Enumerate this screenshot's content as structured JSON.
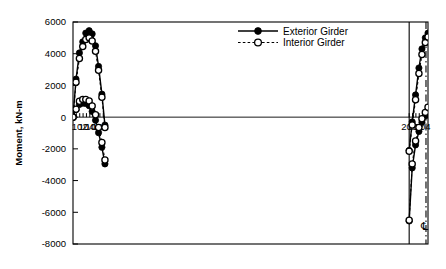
{
  "chart_data": {
    "type": "line",
    "title": "",
    "xlabel": "",
    "ylabel": "Moment, kN-m",
    "ylim": [
      -8000,
      6000
    ],
    "ytick_values": [
      6000,
      4000,
      2000,
      0,
      -2000,
      -4000,
      -6000,
      -8000
    ],
    "ytick_labels": [
      "6000",
      "4000",
      "2000",
      "0",
      "-2000",
      "-4000",
      "-6000",
      "-8000"
    ],
    "xlim": [
      100.0,
      205.6
    ],
    "xtick_values": [
      101,
      102,
      103,
      104,
      105,
      106,
      107,
      108,
      109,
      200,
      201,
      202,
      203,
      204,
      205
    ],
    "xtick_labeled": [
      102,
      104,
      106,
      108,
      200,
      202,
      204
    ],
    "xtick_labels": [
      "102",
      "104",
      "106",
      "108",
      "200",
      "202",
      "204"
    ],
    "grid": false,
    "legend_position": "top-right",
    "series": [
      {
        "name": "Exterior Girder",
        "marker": "filled-circle",
        "linestyle": "solid",
        "color": "#000000",
        "envelopes": [
          {
            "name": "positive-moment-envelope",
            "x": [
              100.0,
              100.9,
              101.9,
              102.9,
              103.8,
              104.8,
              105.7,
              106.7,
              107.6,
              108.6,
              109.5,
              200.0,
              200.9,
              201.9,
              202.9,
              203.8,
              204.8,
              205.6
            ],
            "y": [
              0,
              480,
              800,
              880,
              860,
              720,
              360,
              -200,
              -980,
              -1900,
              -2950,
              -6550,
              -3200,
              -1750,
              -900,
              -320,
              80,
              380
            ]
          },
          {
            "name": "negative-moment-envelope",
            "x": [
              100.0,
              100.9,
              101.9,
              102.9,
              103.8,
              104.8,
              105.7,
              106.7,
              107.6,
              108.6,
              109.5,
              200.0,
              200.9,
              201.9,
              202.9,
              203.8,
              204.8,
              205.6
            ],
            "y": [
              0,
              2400,
              4050,
              4750,
              5300,
              5450,
              5250,
              4500,
              3200,
              1450,
              -500,
              -2100,
              -300,
              1400,
              3100,
              4300,
              5000,
              5300
            ]
          }
        ]
      },
      {
        "name": "Interior Girder",
        "marker": "open-circle",
        "linestyle": "dotted",
        "color": "#000000",
        "envelopes": [
          {
            "name": "positive-moment-envelope",
            "x": [
              100.0,
              100.9,
              101.9,
              102.9,
              103.8,
              104.8,
              105.7,
              106.7,
              107.6,
              108.6,
              109.5,
              200.0,
              200.9,
              201.9,
              202.9,
              203.8,
              204.8,
              205.6
            ],
            "y": [
              0,
              500,
              1000,
              1120,
              1120,
              1020,
              700,
              150,
              -650,
              -1600,
              -2700,
              -6500,
              -2950,
              -1500,
              -650,
              -100,
              300,
              620
            ]
          },
          {
            "name": "negative-moment-envelope",
            "x": [
              100.0,
              100.9,
              101.9,
              102.9,
              103.8,
              104.8,
              105.7,
              106.7,
              107.6,
              108.6,
              109.5,
              200.0,
              200.9,
              201.9,
              202.9,
              203.8,
              204.8,
              205.6
            ],
            "y": [
              0,
              2200,
              3700,
              4450,
              4900,
              5000,
              4800,
              4150,
              2950,
              1250,
              -650,
              -2150,
              -500,
              1100,
              2750,
              3950,
              4700,
              5050
            ]
          }
        ]
      }
    ],
    "annotations": [
      {
        "name": "pier-line",
        "type": "vertical-line",
        "x": 200.0,
        "style": "solid"
      },
      {
        "name": "centerline",
        "type": "vertical-line",
        "x": 205.0,
        "style": "dash-dot",
        "label": "℄"
      }
    ]
  },
  "legend": {
    "items": [
      {
        "label": "Exterior Girder",
        "marker": "filled-circle",
        "linestyle": "solid"
      },
      {
        "label": "Interior Girder",
        "marker": "open-circle",
        "linestyle": "dotted"
      }
    ]
  },
  "axes": {
    "y_title": "Moment, kN-m"
  }
}
